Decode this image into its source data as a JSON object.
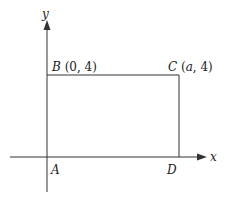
{
  "diagram": {
    "axes": {
      "x_label": "x",
      "y_label": "y"
    },
    "points": {
      "A": {
        "name": "A",
        "coords": ""
      },
      "B": {
        "name": "B",
        "coords": " (0, 4)"
      },
      "C": {
        "name": "C",
        "coords_open": " (",
        "coords_var": "a",
        "coords_close": ", 4)"
      },
      "D": {
        "name": "D",
        "coords": ""
      }
    },
    "colors": {
      "line": "#333333",
      "text": "#222222",
      "background": "#ffffff"
    }
  }
}
